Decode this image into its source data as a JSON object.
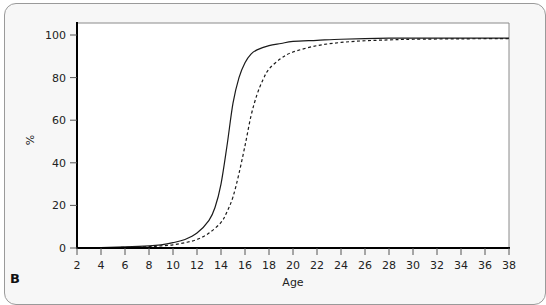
{
  "panel_label": "B",
  "chart_data": {
    "type": "line",
    "title": "",
    "xlabel": "Age",
    "ylabel": "%",
    "xlim": [
      2,
      38
    ],
    "ylim": [
      0,
      100
    ],
    "xticks": [
      2,
      4,
      6,
      8,
      10,
      12,
      14,
      16,
      18,
      20,
      22,
      24,
      26,
      28,
      30,
      32,
      34,
      36,
      38
    ],
    "yticks": [
      0,
      20,
      40,
      60,
      80,
      100
    ],
    "grid": false,
    "legend": null,
    "series": [
      {
        "name": "solid",
        "style": "solid",
        "x": [
          2,
          4,
          6,
          8,
          9,
          10,
          11,
          12,
          13,
          13.5,
          14,
          14.5,
          15,
          15.5,
          16,
          16.5,
          17,
          18,
          19,
          20,
          22,
          24,
          26,
          28,
          30,
          34,
          38
        ],
        "y": [
          0,
          0.2,
          0.5,
          1,
          1.5,
          2.5,
          4,
          7,
          13,
          19,
          30,
          48,
          68,
          80,
          87,
          91,
          93,
          95,
          96,
          97,
          97.5,
          98,
          98.3,
          98.5,
          98.5,
          98.5,
          98.5
        ]
      },
      {
        "name": "dashed",
        "style": "dashed",
        "x": [
          2,
          4,
          6,
          8,
          9,
          10,
          11,
          12,
          13,
          14,
          14.5,
          15,
          15.5,
          16,
          16.5,
          17,
          17.5,
          18,
          19,
          20,
          22,
          24,
          26,
          28,
          30,
          34,
          38
        ],
        "y": [
          0,
          0.1,
          0.3,
          0.6,
          1,
          1.5,
          2.5,
          4,
          7,
          12,
          17,
          24,
          35,
          48,
          62,
          72,
          79,
          84,
          89,
          92,
          95,
          96.5,
          97.3,
          97.7,
          98,
          98.2,
          98.3
        ]
      }
    ]
  }
}
